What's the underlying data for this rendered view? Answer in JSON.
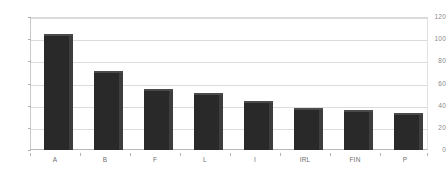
{
  "chart_data": {
    "type": "bar",
    "title": "",
    "subtitle": "",
    "xlabel": "",
    "ylabel": "",
    "categories": [
      "A",
      "B",
      "F",
      "L",
      "I",
      "IRL",
      "FIN",
      "P"
    ],
    "values": [
      105,
      71,
      55,
      51,
      44,
      38,
      36,
      33
    ],
    "series": [
      {
        "name": "",
        "values": [
          105,
          71,
          55,
          51,
          44,
          38,
          36,
          33
        ]
      }
    ],
    "ylim": [
      0,
      120
    ],
    "yticks": [
      0,
      20,
      40,
      60,
      80,
      100,
      120
    ],
    "ytick_labels": [
      "0",
      "20",
      "40",
      "60",
      "80",
      "100",
      "120"
    ],
    "grid": true,
    "legend": false,
    "legend_position": "none",
    "annotations": [],
    "colors": {
      "bar_face": "#292929",
      "bar_side": "#3d3d3d",
      "bar_top": "#4a4a4a",
      "gridline": "#dcdcdc",
      "axis": "#b9b9b9",
      "tick_text": "#8a8a8a",
      "category_text": "#6f6f6f",
      "background": "#ffffff"
    }
  }
}
